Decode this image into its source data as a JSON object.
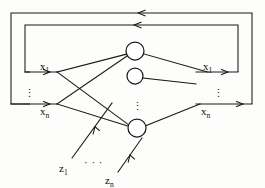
{
  "diagram": {
    "type": "neural-network-schematic",
    "stroke_color": "#1a1a1a",
    "background_color": "#fdfdfc",
    "inputs_left": [
      {
        "id": "x1",
        "base": "x",
        "sub": "1",
        "x": 40,
        "y": 73
      },
      {
        "id": "xn",
        "base": "x",
        "sub": "n",
        "x": 40,
        "y": 110
      }
    ],
    "outputs_right": [
      {
        "id": "x1out",
        "base": "x",
        "sub": "1",
        "x": 207,
        "y": 73
      },
      {
        "id": "xnout",
        "base": "x",
        "sub": "n",
        "x": 205,
        "y": 110
      }
    ],
    "inputs_bottom": [
      {
        "id": "z1",
        "base": "z",
        "sub": "1",
        "x": 64,
        "y": 170
      },
      {
        "id": "zn",
        "base": "z",
        "sub": "n",
        "x": 110,
        "y": 182
      }
    ],
    "neurons": [
      {
        "id": "neuron-top",
        "cx": 135,
        "cy": 51,
        "r": 9
      },
      {
        "id": "neuron-middle",
        "cx": 135,
        "cy": 76,
        "r": 8
      },
      {
        "id": "neuron-bottom",
        "cx": 137,
        "cy": 128,
        "r": 9
      }
    ],
    "ellipsis": [
      {
        "id": "left-vertical-dots",
        "glyph": "⋮",
        "x": 28,
        "y": 93
      },
      {
        "id": "right-vertical-dots",
        "glyph": "⋮",
        "x": 216,
        "y": 93
      },
      {
        "id": "middle-vertical-dots",
        "glyph": "⋮",
        "x": 135,
        "y": 105
      },
      {
        "id": "bottom-horizontal-dots",
        "glyph": "· · ·",
        "x": 88,
        "y": 163
      }
    ],
    "feedback_loops": [
      {
        "id": "outer-feedback-loop",
        "direction": "right-to-left",
        "top_y": 13
      },
      {
        "id": "inner-feedback-loop",
        "direction": "right-to-left",
        "top_y": 25
      }
    ]
  }
}
